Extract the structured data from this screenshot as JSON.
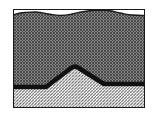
{
  "figure": {
    "title": "geologic-cross-section",
    "description": "Schematic cross section showing a hatched bedrock unit with an anticlinal arch overlain by a cross-hatched surficial unit beneath an undulating ground surface.",
    "width": 157,
    "height": 122,
    "background_color": "#ffffff"
  },
  "frame": {
    "name": "section-box",
    "x": 13,
    "y": 9,
    "width": 132,
    "height": 99,
    "stroke_color": "#1a1a1a",
    "stroke_width": 1
  },
  "surface": {
    "name": "ground-surface",
    "label": "undulating ground surface",
    "stroke_color": "#1a1a1a",
    "stroke_width": 1.2,
    "points": [
      [
        13,
        15
      ],
      [
        24,
        12.5
      ],
      [
        36,
        12
      ],
      [
        48,
        14
      ],
      [
        60,
        15.5
      ],
      [
        72,
        14
      ],
      [
        84,
        11.5
      ],
      [
        96,
        10
      ],
      [
        108,
        10.5
      ],
      [
        120,
        13
      ],
      [
        132,
        15
      ],
      [
        145,
        15.5
      ]
    ]
  },
  "upper_unit": {
    "name": "overburden-unit",
    "label": "cross-hatched surficial deposit",
    "pattern": "cross-hatch",
    "pattern_spacing_px": 3,
    "pattern_color": "#4d4d4d",
    "fill_color": "#ffffff"
  },
  "lower_unit": {
    "name": "bedrock-unit",
    "label": "diagonally hatched bedrock",
    "pattern": "diagonal-hatch",
    "pattern_spacing_px": 3,
    "pattern_color": "#6b6b6b",
    "fill_color": "#ffffff"
  },
  "contact": {
    "name": "bedrock-contact",
    "label": "bedrock contact with anticlinal arch",
    "stroke_color": "#111111",
    "stroke_width": 4.6,
    "points": [
      [
        13,
        87
      ],
      [
        30,
        87
      ],
      [
        46,
        87
      ],
      [
        58,
        78
      ],
      [
        70,
        68
      ],
      [
        75,
        65
      ],
      [
        80,
        68
      ],
      [
        92,
        77
      ],
      [
        104,
        84
      ],
      [
        118,
        84
      ],
      [
        132,
        84
      ],
      [
        145,
        84
      ]
    ],
    "peak": {
      "x": 75,
      "y": 65
    },
    "left_base_y": 87,
    "right_base_y": 84
  }
}
